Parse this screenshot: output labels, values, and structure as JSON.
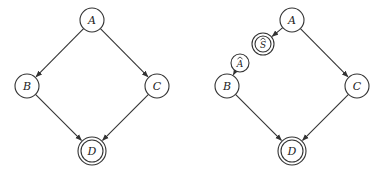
{
  "diagrams": [
    {
      "id": "left",
      "nodes": [
        {
          "key": "A",
          "label": "A",
          "x": 92,
          "y": 20,
          "r": 12,
          "double": false,
          "hat": false
        },
        {
          "key": "B",
          "label": "B",
          "x": 27,
          "y": 86,
          "r": 12,
          "double": false,
          "hat": false
        },
        {
          "key": "C",
          "label": "C",
          "x": 157,
          "y": 86,
          "r": 12,
          "double": false,
          "hat": false
        },
        {
          "key": "D",
          "label": "D",
          "x": 92,
          "y": 151,
          "r": 12,
          "double": true,
          "hat": false
        }
      ],
      "edges": [
        {
          "from": "A",
          "to": "B"
        },
        {
          "from": "A",
          "to": "C"
        },
        {
          "from": "B",
          "to": "D"
        },
        {
          "from": "C",
          "to": "D"
        }
      ]
    },
    {
      "id": "right",
      "nodes": [
        {
          "key": "A",
          "label": "A",
          "x": 292,
          "y": 20,
          "r": 12,
          "double": false,
          "hat": false
        },
        {
          "key": "S_hat",
          "label": "S",
          "x": 263,
          "y": 44,
          "r": 9,
          "double": true,
          "hat": true
        },
        {
          "key": "A_hat",
          "label": "A",
          "x": 240,
          "y": 63,
          "r": 9,
          "double": false,
          "hat": true
        },
        {
          "key": "B",
          "label": "B",
          "x": 227,
          "y": 86,
          "r": 12,
          "double": false,
          "hat": false
        },
        {
          "key": "C",
          "label": "C",
          "x": 357,
          "y": 86,
          "r": 12,
          "double": false,
          "hat": false
        },
        {
          "key": "D",
          "label": "D",
          "x": 292,
          "y": 151,
          "r": 12,
          "double": true,
          "hat": false
        }
      ],
      "edges": [
        {
          "from": "A",
          "to": "S_hat"
        },
        {
          "from": "A_hat",
          "to": "B"
        },
        {
          "from": "A",
          "to": "C"
        },
        {
          "from": "B",
          "to": "D"
        },
        {
          "from": "C",
          "to": "D"
        }
      ]
    }
  ],
  "colors": {
    "stroke": "#333333",
    "background": "#ffffff"
  }
}
